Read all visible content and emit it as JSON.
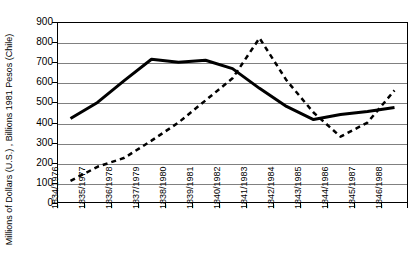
{
  "chart_data": {
    "type": "line",
    "title": "",
    "xlabel": "",
    "ylabel": "Millions of Dollars (U.S.) ,  Billions 1981 Pesos (Chile)",
    "ylim": [
      0,
      900
    ],
    "yticks": [
      0,
      100,
      200,
      300,
      400,
      500,
      600,
      700,
      800,
      900
    ],
    "grid": "horizontal",
    "legend": "none",
    "categories": [
      "1834/1976",
      "1835/1977",
      "1836/1978",
      "1837/1979",
      "1838/1980",
      "1839/1981",
      "1840/1982",
      "1841/1983",
      "1842/1984",
      "1843/1985",
      "1844/1986",
      "1845/1987",
      "1846/1988"
    ],
    "series": [
      {
        "name": "Millions of Dollars (U.S.)",
        "style": "solid",
        "color": "#000000",
        "width": 3,
        "values": [
          420,
          500,
          610,
          715,
          700,
          710,
          668,
          570,
          480,
          415,
          440,
          455,
          475
        ]
      },
      {
        "name": "Billions 1981 Pesos (Chile)",
        "style": "dashed",
        "color": "#000000",
        "width": 2.5,
        "values": [
          110,
          180,
          225,
          310,
          400,
          510,
          620,
          820,
          610,
          450,
          330,
          400,
          560
        ]
      }
    ]
  }
}
